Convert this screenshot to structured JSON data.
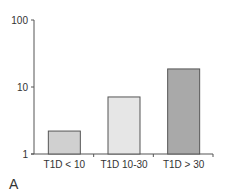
{
  "chart_data": {
    "type": "bar",
    "title": "",
    "xlabel": "",
    "ylabel": "",
    "yscale": "log",
    "ylim": [
      1,
      100
    ],
    "yticks": [
      1,
      10,
      100
    ],
    "ytick_labels": [
      "1",
      "10",
      "100"
    ],
    "categories": [
      "T1D < 10",
      "T1D 10-30",
      "T1D > 30"
    ],
    "values": [
      2.2,
      7.1,
      18.6
    ],
    "bar_colors": [
      "#d0d0d0",
      "#e6e6e6",
      "#a9a9a9"
    ],
    "grid": false,
    "legend": null
  },
  "panel_label": "A",
  "colors": {
    "axis": "#555555",
    "bar_outline": "#555555"
  }
}
